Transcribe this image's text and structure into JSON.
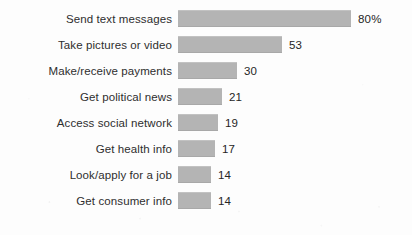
{
  "chart_data": {
    "type": "bar",
    "orientation": "horizontal",
    "title": "",
    "subtitle": "",
    "xlabel": "",
    "ylabel": "",
    "grid": false,
    "legend": null,
    "legend_position": "none",
    "axis_visible": false,
    "tick_labels": [],
    "xlim": [
      0,
      80
    ],
    "value_unit": "percent",
    "bar_color": "#b4b4b4",
    "background_color": "#fdfdfd",
    "text_color": "#2b2b2b",
    "categories": [
      "Send text messages",
      "Take pictures or video",
      "Make/receive payments",
      "Get political news",
      "Access social network",
      "Get health info",
      "Look/apply for a job",
      "Get consumer info"
    ],
    "values": [
      80,
      53,
      30,
      21,
      19,
      17,
      14,
      14
    ],
    "value_labels": [
      "80%",
      "53",
      "30",
      "21",
      "19",
      "17",
      "14",
      "14"
    ],
    "bars": [
      {
        "category": "Send text messages",
        "value": 80,
        "label": "80%",
        "bar_px": 173
      },
      {
        "category": "Take pictures or video",
        "value": 53,
        "label": "53",
        "bar_px": 104
      },
      {
        "category": "Make/receive payments",
        "value": 30,
        "label": "30",
        "bar_px": 59
      },
      {
        "category": "Get political news",
        "value": 21,
        "label": "21",
        "bar_px": 44
      },
      {
        "category": "Access social network",
        "value": 19,
        "label": "19",
        "bar_px": 40
      },
      {
        "category": "Get health info",
        "value": 17,
        "label": "17",
        "bar_px": 37
      },
      {
        "category": "Look/apply for a job",
        "value": 14,
        "label": "14",
        "bar_px": 33
      },
      {
        "category": "Get consumer info",
        "value": 14,
        "label": "14",
        "bar_px": 33
      }
    ]
  }
}
